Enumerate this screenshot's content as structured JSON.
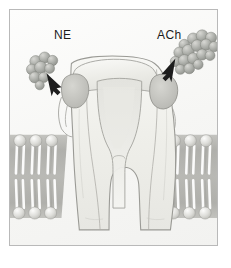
{
  "figure": {
    "type": "diagram",
    "style": "pencil and watercolor scientific illustration",
    "background_color": "#fbfbfa",
    "frame_color": "#b9b9b9"
  },
  "labels": {
    "left_ligand": "NE",
    "right_ligand": "ACh"
  },
  "ligands": [
    {
      "name": "NE",
      "label": "NE",
      "description": "space-filling molecular cluster",
      "side": "left",
      "sphere_count": 9,
      "color": "#a6a8a4"
    },
    {
      "name": "ACh",
      "label": "ACh",
      "description": "space-filling molecular cluster",
      "side": "right",
      "sphere_count": 17,
      "color": "#a9aba7"
    }
  ],
  "arrows": [
    {
      "name": "ne-arrow",
      "points_to": "left binding pocket",
      "direction": "down-right"
    },
    {
      "name": "ach-arrow",
      "points_to": "right binding pocket",
      "direction": "down-left"
    }
  ],
  "receptor": {
    "name": "receptor protein",
    "fill_color": "#f0f0ec",
    "outline_color": "#9a9a96",
    "pore": "central funnel narrowing to channel",
    "binding_pockets": [
      {
        "name": "left-binding-pocket",
        "fill": "#c9c9c4"
      },
      {
        "name": "right-binding-pocket",
        "fill": "#c2c2bd"
      }
    ]
  },
  "membrane": {
    "name": "lipid bilayer",
    "head_color": "#dcdcd8",
    "tail_color": "#ffffff",
    "band_color": "#9e9e99",
    "leaflets": 2,
    "left_lipid_pairs": 4,
    "right_lipid_pairs": 4,
    "top_y": 128,
    "bottom_y": 212
  }
}
